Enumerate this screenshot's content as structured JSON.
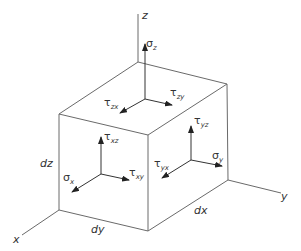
{
  "axes": {
    "x": "x",
    "y": "y",
    "z": "z"
  },
  "dimensions": {
    "dx": "dx",
    "dy": "dy",
    "dz": "dz"
  },
  "stresses": {
    "sigma_z": {
      "symbol": "σ",
      "sub": "z"
    },
    "tau_zx": {
      "symbol": "τ",
      "sub": "zx"
    },
    "tau_zy": {
      "symbol": "τ",
      "sub": "zy"
    },
    "tau_xz": {
      "symbol": "τ",
      "sub": "xz"
    },
    "tau_xy": {
      "symbol": "τ",
      "sub": "xy"
    },
    "sigma_x": {
      "symbol": "σ",
      "sub": "x"
    },
    "tau_yz": {
      "symbol": "τ",
      "sub": "yz"
    },
    "tau_yx": {
      "symbol": "τ",
      "sub": "yx"
    },
    "sigma_y": {
      "symbol": "σ",
      "sub": "y"
    }
  },
  "colors": {
    "lines": "#6a6a6a",
    "text": "#333333",
    "background": "#ffffff"
  }
}
